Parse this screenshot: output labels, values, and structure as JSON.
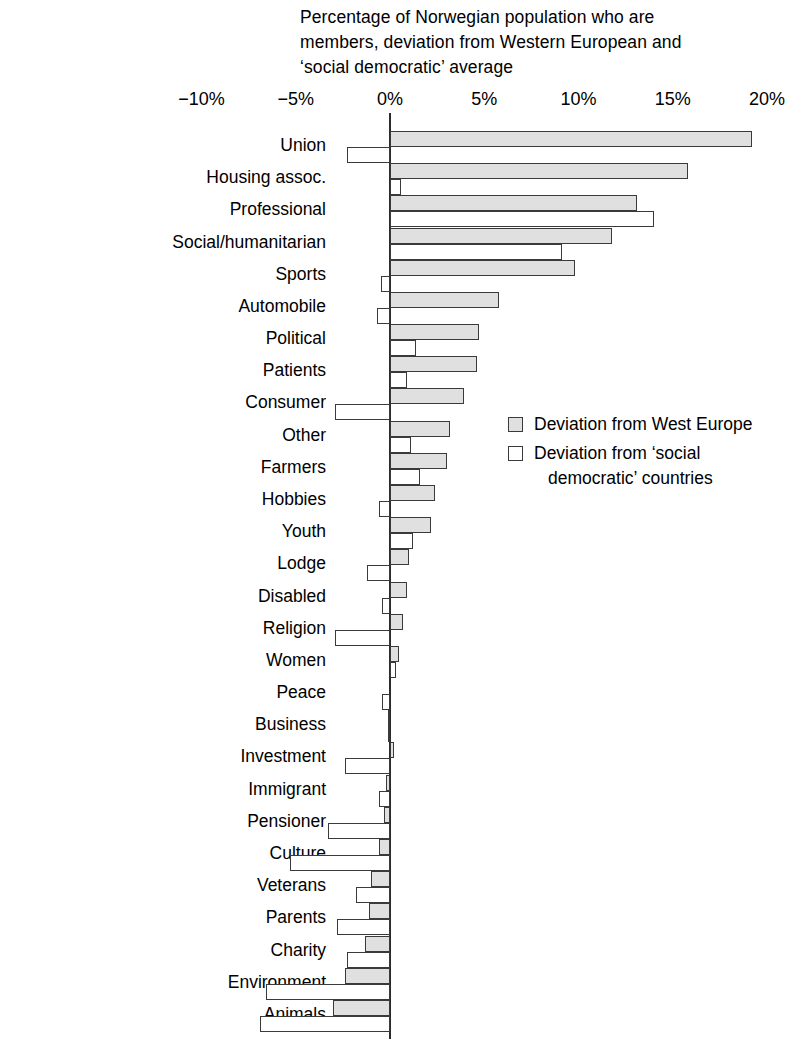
{
  "chart_data": {
    "type": "bar",
    "orientation": "horizontal",
    "title": "Percentage of Norwegian population who are members, deviation from Western European and ‘social democratic’ average",
    "xlabel": "",
    "ylabel": "",
    "xlim": [
      -12.5,
      21.5
    ],
    "xticks": [
      -10,
      -5,
      0,
      5,
      10,
      15,
      20
    ],
    "xtick_labels": [
      "−10%",
      "−5%",
      "0%",
      "5%",
      "10%",
      "15%",
      "20%"
    ],
    "grid": false,
    "legend_position": "middle-right",
    "zero_line": true,
    "categories": [
      "Union",
      "Housing assoc.",
      "Professional",
      "Social/humanitarian",
      "Sports",
      "Automobile",
      "Political",
      "Patients",
      "Consumer",
      "Other",
      "Farmers",
      "Hobbies",
      "Youth",
      "Lodge",
      "Disabled",
      "Religion",
      "Women",
      "Peace",
      "Business",
      "Investment",
      "Immigrant",
      "Pensioner",
      "Culture",
      "Veterans",
      "Parents",
      "Charity",
      "Environment",
      "Animals"
    ],
    "series": [
      {
        "name": "Deviation from West Europe",
        "color": "#e0e0e0",
        "values": [
          19.2,
          15.8,
          13.1,
          11.8,
          9.8,
          5.8,
          4.7,
          4.6,
          3.9,
          3.2,
          3.0,
          2.4,
          2.2,
          1.0,
          0.9,
          0.7,
          0.5,
          0.0,
          -0.1,
          0.2,
          -0.2,
          -0.3,
          -0.6,
          -1.0,
          -1.1,
          -1.3,
          -2.4,
          -3.0
        ]
      },
      {
        "name": "Deviation from ‘social democratic’ countries",
        "color": "#ffffff",
        "values": [
          -2.3,
          0.6,
          14.0,
          9.1,
          -0.5,
          -0.7,
          1.4,
          0.9,
          -2.9,
          1.1,
          1.6,
          -0.6,
          1.2,
          -1.2,
          -0.4,
          -2.9,
          0.3,
          -0.4,
          -0.1,
          -2.4,
          -0.6,
          -3.3,
          -5.3,
          -1.8,
          -2.8,
          -2.3,
          -6.6,
          -6.9
        ]
      }
    ]
  },
  "legend": {
    "entries": [
      {
        "label": "Deviation from West Europe",
        "label_line2": "",
        "swatch": "gray"
      },
      {
        "label": "Deviation from ‘social",
        "label_line2": "democratic’ countries",
        "swatch": "white"
      }
    ]
  },
  "icons": {
    "legend_swatch_filled": "filled-square-icon",
    "legend_swatch_outline": "outline-square-icon"
  }
}
